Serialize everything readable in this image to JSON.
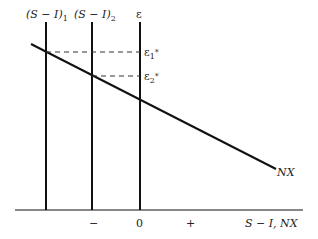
{
  "diagram": {
    "type": "economics-open-economy-saving-investment",
    "curves": [
      {
        "id": "S-I-1",
        "label_main": "(S − I)",
        "label_sub": "1",
        "kind": "vertical"
      },
      {
        "id": "S-I-2",
        "label_main": "(S − I)",
        "label_sub": "2",
        "kind": "vertical"
      },
      {
        "id": "epsilon-axis",
        "label": "ε",
        "kind": "vertical-axis"
      },
      {
        "id": "NX",
        "label": "NX",
        "kind": "downward-sloping"
      }
    ],
    "equilibria": [
      {
        "label_main": "ε",
        "label_sub": "1",
        "label_sup": "*"
      },
      {
        "label_main": "ε",
        "label_sub": "2",
        "label_sup": "*"
      }
    ],
    "x_axis": {
      "label": "S − I, NX",
      "ticks": [
        "−",
        "0",
        "+"
      ]
    },
    "colors": {
      "line": "#111111",
      "dash": "#333333",
      "background": "#ffffff"
    }
  }
}
